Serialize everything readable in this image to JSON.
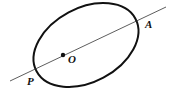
{
  "diagram": {
    "type": "geometry",
    "stroke_color": "#111111",
    "ellipse": {
      "cx": 86,
      "cy": 45,
      "rx": 56,
      "ry": 37,
      "rotation_deg": -28
    },
    "line": {
      "x1": 10,
      "y1": 81,
      "x2": 166,
      "y2": 7
    },
    "points": [
      {
        "id": "O",
        "label": "O",
        "x": 63,
        "y": 55,
        "marked": true
      },
      {
        "id": "A",
        "label": "A",
        "x": 138,
        "y": 21,
        "marked": false
      },
      {
        "id": "P",
        "label": "P",
        "x": 32,
        "y": 70,
        "marked": false
      }
    ],
    "labels": {
      "O": "O",
      "A": "A",
      "P": "P"
    }
  }
}
